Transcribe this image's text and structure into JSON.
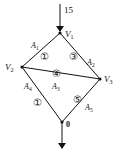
{
  "diagram": {
    "type": "directed-network",
    "input_flow": {
      "value": "15",
      "into": "V1"
    },
    "output_node": "0",
    "nodes": [
      {
        "id": "V1",
        "label_main": "V",
        "label_sub": "1",
        "x": 60,
        "y": 33
      },
      {
        "id": "V2",
        "label_main": "V",
        "label_sub": "2",
        "x": 22,
        "y": 67
      },
      {
        "id": "V3",
        "label_main": "V",
        "label_sub": "3",
        "x": 100,
        "y": 79
      },
      {
        "id": "O",
        "label_main": "0",
        "label_sub": "",
        "x": 62,
        "y": 122
      }
    ],
    "edges": [
      {
        "from": "V1",
        "to": "V2",
        "name_main": "A",
        "name_sub": "1",
        "circled": "①"
      },
      {
        "from": "V1",
        "to": "V3",
        "name_main": "A",
        "name_sub": "2",
        "circled": "③"
      },
      {
        "from": "V2",
        "to": "V3",
        "name_main": "A",
        "name_sub": "3",
        "circled": "④"
      },
      {
        "from": "V2",
        "to": "O",
        "name_main": "A",
        "name_sub": "4",
        "circled": "①"
      },
      {
        "from": "V3",
        "to": "O",
        "name_main": "A",
        "name_sub": "5",
        "circled": "⑤"
      }
    ],
    "colors": {
      "line": "#111111",
      "background": "#ffffff"
    }
  }
}
